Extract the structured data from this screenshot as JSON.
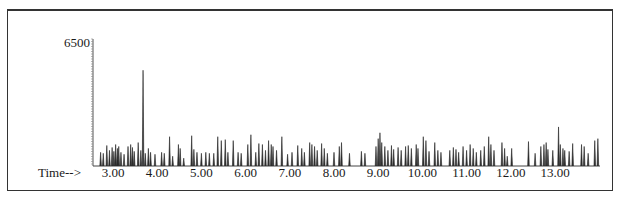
{
  "chart_data": {
    "type": "bar",
    "title": "",
    "xlabel": "Time-->",
    "ylabel": "",
    "y_top_label": "6500",
    "ylim": [
      0,
      6500
    ],
    "xlim": [
      2.55,
      13.95
    ],
    "x_ticks": [
      "3.00",
      "4.00",
      "5.00",
      "6.00",
      "7.00",
      "8.00",
      "9.00",
      "10.00",
      "11.00",
      "12.00",
      "13.00"
    ],
    "grid": false,
    "legend": null,
    "peaks": [
      [
        2.72,
        700
      ],
      [
        2.78,
        650
      ],
      [
        2.86,
        1050
      ],
      [
        2.92,
        800
      ],
      [
        2.98,
        950
      ],
      [
        3.02,
        750
      ],
      [
        3.06,
        1100
      ],
      [
        3.1,
        900
      ],
      [
        3.13,
        1000
      ],
      [
        3.18,
        700
      ],
      [
        3.25,
        600
      ],
      [
        3.34,
        1000
      ],
      [
        3.4,
        1100
      ],
      [
        3.44,
        950
      ],
      [
        3.48,
        750
      ],
      [
        3.57,
        1200
      ],
      [
        3.63,
        800
      ],
      [
        3.68,
        4900
      ],
      [
        3.73,
        650
      ],
      [
        3.8,
        900
      ],
      [
        3.85,
        700
      ],
      [
        3.95,
        600
      ],
      [
        4.1,
        700
      ],
      [
        4.16,
        650
      ],
      [
        4.28,
        1500
      ],
      [
        4.35,
        500
      ],
      [
        4.48,
        1100
      ],
      [
        4.52,
        900
      ],
      [
        4.6,
        400
      ],
      [
        4.78,
        1550
      ],
      [
        4.83,
        850
      ],
      [
        4.9,
        700
      ],
      [
        5.0,
        650
      ],
      [
        5.1,
        700
      ],
      [
        5.18,
        650
      ],
      [
        5.28,
        650
      ],
      [
        5.37,
        1500
      ],
      [
        5.45,
        1300
      ],
      [
        5.54,
        1350
      ],
      [
        5.6,
        700
      ],
      [
        5.72,
        1300
      ],
      [
        5.83,
        700
      ],
      [
        5.9,
        650
      ],
      [
        6.05,
        1100
      ],
      [
        6.12,
        1600
      ],
      [
        6.23,
        700
      ],
      [
        6.3,
        1150
      ],
      [
        6.38,
        1100
      ],
      [
        6.45,
        800
      ],
      [
        6.52,
        1300
      ],
      [
        6.58,
        1100
      ],
      [
        6.62,
        1000
      ],
      [
        6.7,
        800
      ],
      [
        6.82,
        1500
      ],
      [
        6.95,
        600
      ],
      [
        7.05,
        700
      ],
      [
        7.18,
        1050
      ],
      [
        7.27,
        900
      ],
      [
        7.33,
        700
      ],
      [
        7.45,
        1200
      ],
      [
        7.5,
        1100
      ],
      [
        7.56,
        1000
      ],
      [
        7.62,
        800
      ],
      [
        7.72,
        1150
      ],
      [
        7.78,
        900
      ],
      [
        7.85,
        650
      ],
      [
        8.0,
        700
      ],
      [
        8.12,
        1000
      ],
      [
        8.17,
        1200
      ],
      [
        8.35,
        650
      ],
      [
        8.62,
        750
      ],
      [
        8.7,
        650
      ],
      [
        8.95,
        1000
      ],
      [
        9.0,
        1400
      ],
      [
        9.04,
        1700
      ],
      [
        9.08,
        1200
      ],
      [
        9.15,
        1000
      ],
      [
        9.22,
        800
      ],
      [
        9.3,
        1050
      ],
      [
        9.35,
        850
      ],
      [
        9.45,
        950
      ],
      [
        9.52,
        800
      ],
      [
        9.62,
        1000
      ],
      [
        9.68,
        1050
      ],
      [
        9.75,
        900
      ],
      [
        9.86,
        1100
      ],
      [
        9.9,
        900
      ],
      [
        10.02,
        1500
      ],
      [
        10.08,
        1300
      ],
      [
        10.15,
        750
      ],
      [
        10.28,
        1200
      ],
      [
        10.35,
        800
      ],
      [
        10.42,
        700
      ],
      [
        10.62,
        800
      ],
      [
        10.7,
        950
      ],
      [
        10.76,
        850
      ],
      [
        10.82,
        700
      ],
      [
        10.92,
        1000
      ],
      [
        11.0,
        800
      ],
      [
        11.08,
        1100
      ],
      [
        11.15,
        900
      ],
      [
        11.22,
        700
      ],
      [
        11.32,
        800
      ],
      [
        11.4,
        1000
      ],
      [
        11.5,
        1500
      ],
      [
        11.55,
        1100
      ],
      [
        11.62,
        800
      ],
      [
        11.8,
        1200
      ],
      [
        11.86,
        900
      ],
      [
        11.92,
        500
      ],
      [
        12.02,
        900
      ],
      [
        12.4,
        1250
      ],
      [
        12.55,
        650
      ],
      [
        12.68,
        1000
      ],
      [
        12.75,
        1100
      ],
      [
        12.8,
        1200
      ],
      [
        12.84,
        850
      ],
      [
        12.95,
        800
      ],
      [
        13.08,
        2000
      ],
      [
        13.12,
        1100
      ],
      [
        13.18,
        900
      ],
      [
        13.22,
        800
      ],
      [
        13.32,
        750
      ],
      [
        13.4,
        1150
      ],
      [
        13.6,
        1100
      ],
      [
        13.66,
        1000
      ],
      [
        13.75,
        650
      ],
      [
        13.9,
        1300
      ],
      [
        13.97,
        1400
      ]
    ]
  }
}
